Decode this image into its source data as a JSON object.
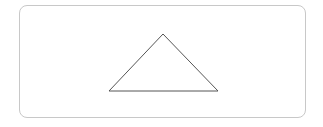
{
  "diagram": {
    "frame": {
      "x": 19,
      "y": 5,
      "width": 287,
      "height": 113,
      "border_color": "#c8c8c8",
      "corner_radius": 8
    },
    "shapes": [
      {
        "type": "triangle",
        "points": [
          [
            163,
            34
          ],
          [
            109,
            91
          ],
          [
            218,
            91
          ]
        ],
        "stroke": "#555555",
        "stroke_width": 1,
        "fill": "none"
      }
    ]
  }
}
